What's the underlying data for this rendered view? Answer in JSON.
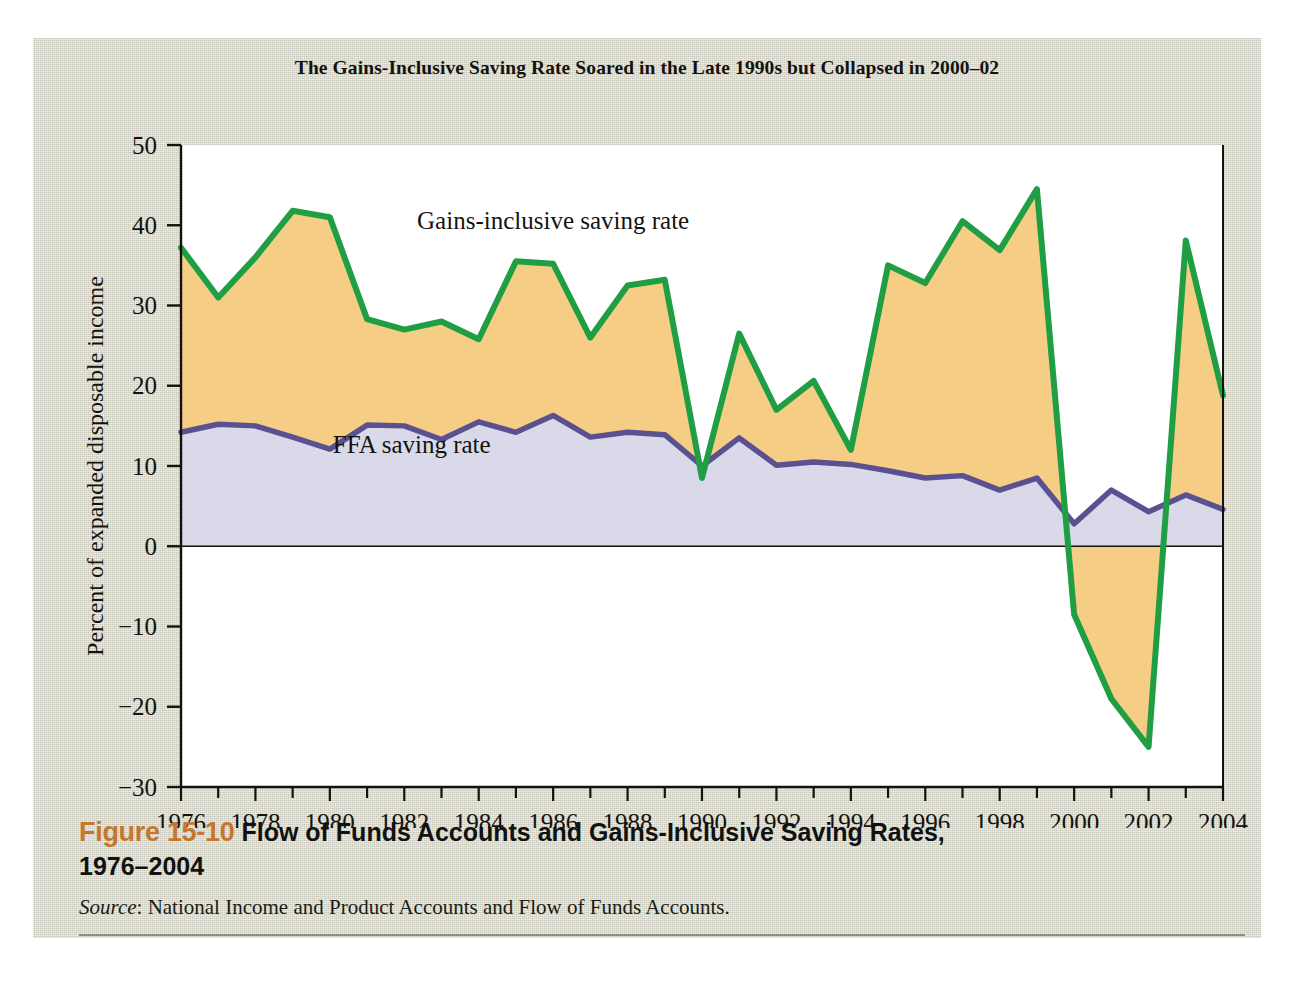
{
  "figure": {
    "number": "Figure 15-10",
    "caption_line1": "Flow of Funds Accounts and Gains-Inclusive Saving Rates,",
    "caption_line2": "1976–2004",
    "source_label": "Source",
    "source_text": ": National Income and Product Accounts and Flow of Funds Accounts."
  },
  "colors": {
    "panel_background": "#dcdcd0",
    "plot_background": "#ffffff",
    "gains_line": "#1f9e44",
    "gains_fill": "#f5cd85",
    "ffa_line": "#5b5090",
    "ffa_fill": "#d9d9e9",
    "axis": "#14120f",
    "figure_number": "#c8762a",
    "rule": "#8d8d82"
  },
  "chart_data": {
    "type": "area",
    "title": "The Gains-Inclusive Saving Rate Soared in the Late 1990s but Collapsed in 2000–02",
    "xlabel": "",
    "ylabel": "Percent of expanded disposable income",
    "xlim": [
      1976,
      2004
    ],
    "ylim": [
      -30,
      50
    ],
    "ytick_step": 10,
    "xtick_step": 1,
    "xlabel_step": 2,
    "grid": false,
    "legend": "inline-annotations",
    "yticks": [
      50,
      40,
      30,
      20,
      10,
      0,
      -10,
      -20,
      -30
    ],
    "ytick_labels": [
      "50",
      "40",
      "30",
      "20",
      "10",
      "0",
      "−10",
      "−20",
      "−30"
    ],
    "xticks": [
      1976,
      1977,
      1978,
      1979,
      1980,
      1981,
      1982,
      1983,
      1984,
      1985,
      1986,
      1987,
      1988,
      1989,
      1990,
      1991,
      1992,
      1993,
      1994,
      1995,
      1996,
      1997,
      1998,
      1999,
      2000,
      2001,
      2002,
      2003,
      2004
    ],
    "xtick_labels": [
      "1976",
      "",
      "1978",
      "",
      "1980",
      "",
      "1982",
      "",
      "1984",
      "",
      "1986",
      "",
      "1988",
      "",
      "1990",
      "",
      "1992",
      "",
      "1994",
      "",
      "1996",
      "",
      "1998",
      "",
      "2000",
      "",
      "2002",
      "",
      "2004"
    ],
    "x": [
      1976,
      1977,
      1978,
      1979,
      1980,
      1981,
      1982,
      1983,
      1984,
      1985,
      1986,
      1987,
      1988,
      1989,
      1990,
      1991,
      1992,
      1993,
      1994,
      1995,
      1996,
      1997,
      1998,
      1999,
      2000,
      2001,
      2002,
      2003,
      2004
    ],
    "series": [
      {
        "name": "Gains-inclusive saving rate",
        "label": "Gains-inclusive saving rate",
        "color": "#1f9e44",
        "fill": "#f5cd85",
        "values": [
          37.2,
          31.0,
          36.0,
          41.8,
          41.0,
          28.3,
          27.0,
          28.0,
          25.8,
          35.5,
          35.2,
          26.0,
          32.5,
          33.2,
          8.5,
          26.5,
          17.0,
          20.6,
          12.0,
          35.0,
          32.8,
          40.5,
          36.9,
          44.5,
          -8.5,
          -19.0,
          -25.0,
          38.1,
          18.8
        ]
      },
      {
        "name": "FFA saving rate",
        "label": "FFA saving rate",
        "color": "#5b5090",
        "fill": "#d9d9e9",
        "values": [
          14.2,
          15.2,
          15.0,
          13.6,
          12.1,
          15.1,
          15.0,
          13.3,
          15.5,
          14.2,
          16.3,
          13.6,
          14.2,
          13.9,
          10.0,
          13.5,
          10.1,
          10.5,
          10.2,
          9.4,
          8.5,
          8.8,
          7.0,
          8.5,
          2.8,
          7.0,
          4.3,
          6.4,
          4.6
        ]
      }
    ],
    "annotations": [
      {
        "text": "Gains-inclusive saving rate",
        "x": 1986.0,
        "y": 39.5
      },
      {
        "text": "FFA saving rate",
        "x": 1982.2,
        "y": 11.6
      }
    ]
  }
}
